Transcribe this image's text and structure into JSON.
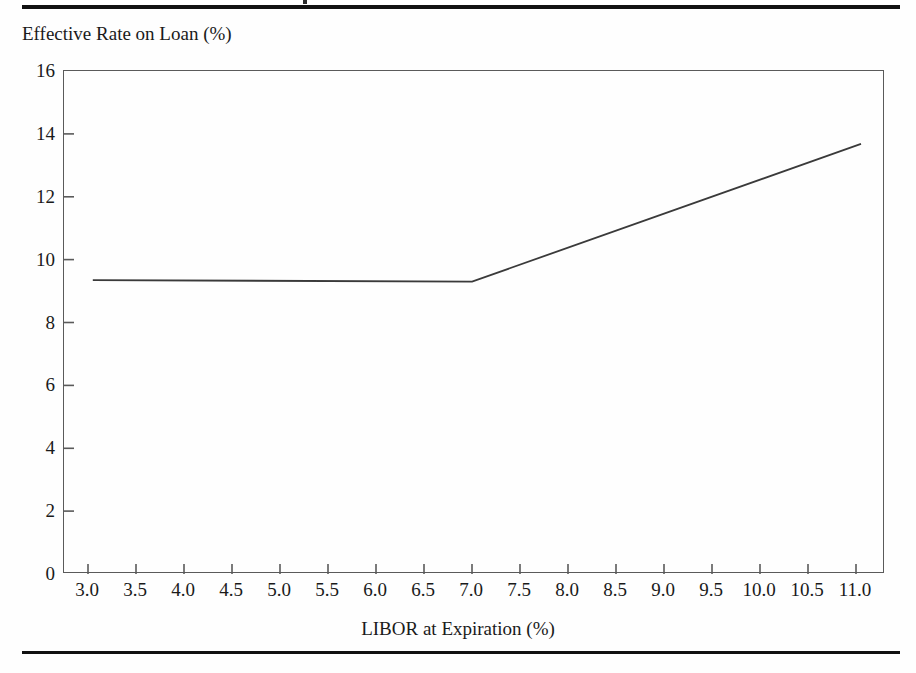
{
  "figure": {
    "background_color": "#fefefe",
    "rule_color": "#111111",
    "axis_color": "#5a5a5a",
    "line_color": "#3a3a3a"
  },
  "chart_data": {
    "type": "line",
    "title": "",
    "xlabel": "LIBOR at Expiration (%)",
    "ylabel": "Effective Rate on Loan (%)",
    "xlim": [
      2.75,
      11.3
    ],
    "ylim": [
      0,
      16
    ],
    "grid": false,
    "legend": null,
    "x_tick_labels": [
      "3.0",
      "3.5",
      "4.0",
      "4.5",
      "5.0",
      "5.5",
      "6.0",
      "6.5",
      "7.0",
      "7.5",
      "8.0",
      "8.5",
      "9.0",
      "9.5",
      "10.0",
      "10.5",
      "11.0"
    ],
    "x_tick_values": [
      3.0,
      3.5,
      4.0,
      4.5,
      5.0,
      5.5,
      6.0,
      6.5,
      7.0,
      7.5,
      8.0,
      8.5,
      9.0,
      9.5,
      10.0,
      10.5,
      11.0
    ],
    "y_tick_labels": [
      "0",
      "2",
      "4",
      "6",
      "8",
      "10",
      "12",
      "14",
      "16"
    ],
    "y_tick_values": [
      0,
      2,
      4,
      6,
      8,
      10,
      12,
      14,
      16
    ],
    "series": [
      {
        "name": "Effective rate on loan",
        "x": [
          3.05,
          7.0,
          11.05
        ],
        "y": [
          9.35,
          9.3,
          13.68
        ]
      }
    ],
    "annotations": [
      {
        "text": "Rate is capped flat at about 9.3% for LIBOR up to 7.0%, then rises roughly one-for-one with LIBOR.",
        "visible": false
      }
    ]
  }
}
